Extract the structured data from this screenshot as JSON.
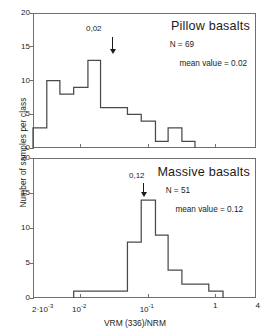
{
  "figure": {
    "ylabel": "Number of samples per class",
    "xlabel": "VRM (336)/NRM",
    "xticks": [
      {
        "value": 0.002,
        "label": "2·10",
        "exp": "-3"
      },
      {
        "value": 0.01,
        "label": "10",
        "exp": "-2"
      },
      {
        "value": 0.1,
        "label": "10",
        "exp": "-1"
      },
      {
        "value": 1,
        "label": "1",
        "exp": ""
      },
      {
        "value": 4,
        "label": "4",
        "exp": ""
      }
    ],
    "yticks": [
      "0",
      "5",
      "10",
      "15",
      "20"
    ]
  },
  "chart_data": [
    {
      "type": "bar",
      "title": "Pillow basalts",
      "n_label": "N = 69",
      "mean_label": "mean value = 0.02",
      "peak_annotation": "0,02",
      "xlabel": "VRM (336)/NRM",
      "ylabel": "Number of samples per class",
      "xscale": "log",
      "xlim": [
        0.002,
        4
      ],
      "ylim": [
        0,
        20
      ],
      "grid": false,
      "bin_edges": [
        0.002,
        0.0032,
        0.005,
        0.008,
        0.013,
        0.02,
        0.032,
        0.05,
        0.08,
        0.13,
        0.2,
        0.32,
        0.5
      ],
      "values": [
        3,
        10,
        8,
        9,
        13,
        6,
        6,
        5,
        4,
        1,
        3,
        1
      ]
    },
    {
      "type": "bar",
      "title": "Massive basalts",
      "n_label": "N = 51",
      "mean_label": "mean value = 0.12",
      "peak_annotation": "0,12",
      "xlabel": "VRM (336)/NRM",
      "ylabel": "Number of samples per class",
      "xscale": "log",
      "xlim": [
        0.002,
        4
      ],
      "ylim": [
        0,
        20
      ],
      "grid": false,
      "bin_edges": [
        0.008,
        0.02,
        0.05,
        0.08,
        0.13,
        0.2,
        0.32,
        0.5,
        0.8,
        1.3
      ],
      "values": [
        1,
        1,
        8,
        14,
        9,
        4,
        2,
        2,
        1
      ]
    }
  ]
}
